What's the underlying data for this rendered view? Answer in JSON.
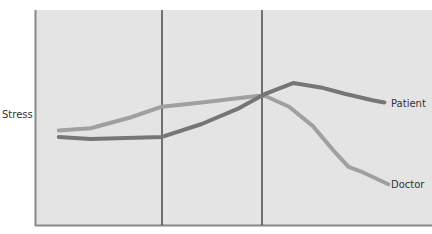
{
  "chart_data": {
    "type": "line",
    "title": "",
    "xlabel": "",
    "ylabel": "Stress",
    "grid": false,
    "legend_position": "inline-right",
    "phase_dividers": 2,
    "x_range": [
      0,
      100
    ],
    "y_range": [
      0,
      100
    ],
    "series": [
      {
        "name": "Patient",
        "color": "#767676",
        "points": [
          [
            6,
            41
          ],
          [
            14,
            40
          ],
          [
            32,
            41
          ],
          [
            42,
            47
          ],
          [
            51,
            54
          ],
          [
            58,
            61
          ],
          [
            65,
            66
          ],
          [
            72,
            64
          ],
          [
            78,
            61
          ],
          [
            85,
            58
          ],
          [
            88,
            57
          ]
        ]
      },
      {
        "name": "Doctor",
        "color": "#a0a0a0",
        "points": [
          [
            6,
            44
          ],
          [
            14,
            45
          ],
          [
            24,
            50
          ],
          [
            32,
            55
          ],
          [
            42,
            57
          ],
          [
            51,
            59
          ],
          [
            56,
            60
          ],
          [
            58,
            60
          ],
          [
            64,
            55
          ],
          [
            70,
            46
          ],
          [
            75,
            35
          ],
          [
            79,
            27
          ],
          [
            82,
            25
          ],
          [
            89,
            19
          ]
        ]
      }
    ]
  },
  "labels": {
    "y_axis": "Stress",
    "patient": "Patient",
    "doctor": "Doctor"
  },
  "colors": {
    "plot_bg": "#e4e4e4",
    "axis": "#888888",
    "divider": "#222222",
    "patient": "#767676",
    "doctor": "#a0a0a0"
  }
}
